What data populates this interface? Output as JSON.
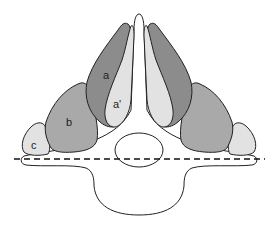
{
  "diagram": {
    "type": "anatomical cross-section",
    "labels": {
      "a": "a",
      "a_prime": "a'",
      "b": "b",
      "c": "c"
    },
    "colors": {
      "muscle_a": "#8c8c8c",
      "muscle_a_prime": "#e2e2e2",
      "muscle_b": "#a9a9a9",
      "muscle_c": "#e2e2e2",
      "outline": "#222222",
      "bone": "#ffffff",
      "reference_line": "#111111"
    },
    "reference_line": "dashed horizontal"
  }
}
